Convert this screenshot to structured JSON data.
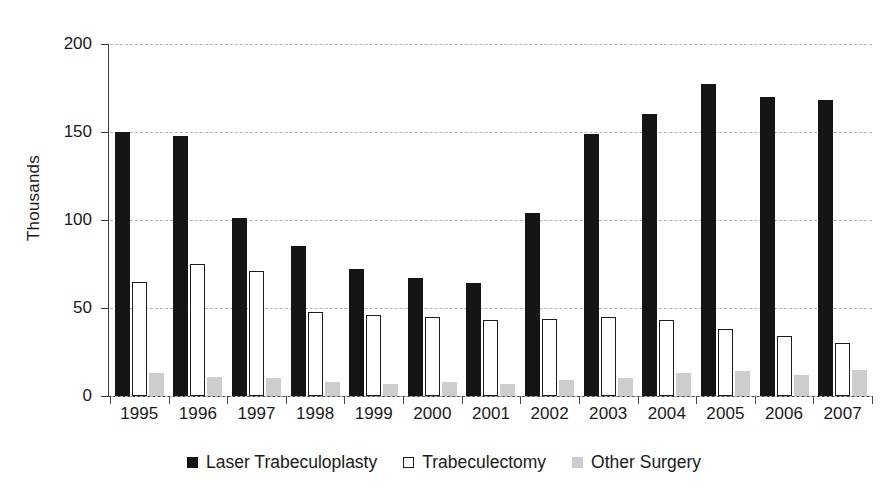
{
  "chart_data": {
    "type": "bar",
    "title": "",
    "subtitle": "",
    "xlabel": "",
    "ylabel": "Thousands",
    "ylim": [
      0,
      200
    ],
    "yticks": [
      0,
      50,
      100,
      150,
      200
    ],
    "ytick_labels": [
      "0",
      "50",
      "100",
      "150",
      "200"
    ],
    "grid": true,
    "grid_style": "dashed horizontal",
    "legend_position": "bottom-center",
    "categories": [
      "1995",
      "1996",
      "1997",
      "1998",
      "1999",
      "2000",
      "2001",
      "2002",
      "2003",
      "2004",
      "2005",
      "2006",
      "2007"
    ],
    "series": [
      {
        "name": "Laser Trabeculoplasty",
        "color": "#151515",
        "style": "solid-black",
        "values": [
          150,
          148,
          101,
          85,
          72,
          67,
          64,
          104,
          149,
          160,
          177,
          170,
          168
        ]
      },
      {
        "name": "Trabeculectomy",
        "color": "#ffffff",
        "style": "white-outlined",
        "values": [
          65,
          75,
          71,
          48,
          46,
          45,
          43,
          44,
          45,
          43,
          38,
          34,
          30
        ]
      },
      {
        "name": "Other Surgery",
        "color": "#cdcdcd",
        "style": "solid-gray",
        "values": [
          13,
          11,
          10,
          8,
          7,
          8,
          7,
          9,
          10,
          13,
          14,
          12,
          15
        ]
      }
    ]
  }
}
